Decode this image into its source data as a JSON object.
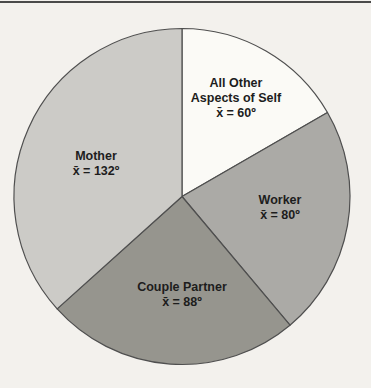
{
  "page": {
    "background_color": "#f3f1ed",
    "top_rule_color": "#4a4a4a",
    "text_color": "#1d1d1d"
  },
  "chart_data": {
    "type": "pie",
    "title": "",
    "description_unit": "degrees",
    "start_angle_deg": 0,
    "direction": "clockwise",
    "total_degrees": 360,
    "geometry": {
      "cx": 182,
      "cy": 196.5,
      "r": 168,
      "stroke": "#4f4f4f",
      "stroke_width": 1.2
    },
    "segments": [
      {
        "name": "all-other-aspects-of-self",
        "label_lines": [
          "All Other",
          "Aspects of Self"
        ],
        "value_label": "x̄ = 60º",
        "mean_degrees": 60,
        "color": "#fbfaf6",
        "label_anchor": {
          "x": 236,
          "y": 98
        }
      },
      {
        "name": "worker",
        "label_lines": [
          "Worker"
        ],
        "value_label": "x̄ = 80º",
        "mean_degrees": 80,
        "color": "#abaaa6",
        "label_anchor": {
          "x": 280,
          "y": 208
        }
      },
      {
        "name": "couple-partner",
        "label_lines": [
          "Couple Partner"
        ],
        "value_label": "x̄ = 88º",
        "mean_degrees": 88,
        "color": "#96958e",
        "label_anchor": {
          "x": 182,
          "y": 295
        }
      },
      {
        "name": "mother",
        "label_lines": [
          "Mother"
        ],
        "value_label": "x̄ = 132º",
        "mean_degrees": 132,
        "color": "#cccbc7",
        "label_anchor": {
          "x": 96,
          "y": 164
        }
      }
    ]
  }
}
